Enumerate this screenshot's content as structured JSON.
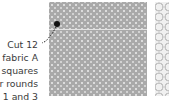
{
  "diagram": {
    "callout": {
      "lines": [
        "Cut 12",
        "fabric A",
        "squares",
        "for rounds",
        "1 and 3"
      ]
    },
    "pieces": [
      {
        "name": "fabric A square",
        "pattern": "grey with white dots"
      },
      {
        "name": "fabric B strip",
        "pattern": "light grey circles"
      }
    ],
    "colors": {
      "fabric_a": "#a9a9a9",
      "fabric_b": "#f0f0f0",
      "text": "#3a3a3a",
      "marker": "#111111"
    }
  }
}
